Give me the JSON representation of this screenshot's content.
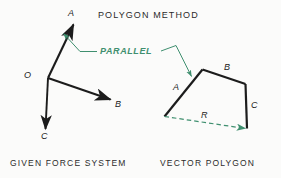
{
  "figure": {
    "title": "POLYGON METHOD",
    "captions": {
      "left": "GIVEN FORCE SYSTEM",
      "right": "VECTOR POLYGON"
    },
    "annotation": {
      "parallel_label": "PARALLEL"
    },
    "colors": {
      "ink": "#1c1c1c",
      "accent_green": "#3f8f6f",
      "background": "#fbfbfa"
    },
    "force_system": {
      "origin_label": "O",
      "vectors": [
        {
          "label": "A",
          "direction": "up-right"
        },
        {
          "label": "B",
          "direction": "down-right"
        },
        {
          "label": "C",
          "direction": "down"
        }
      ]
    },
    "vector_polygon": {
      "sides": [
        {
          "label": "A"
        },
        {
          "label": "B"
        },
        {
          "label": "C"
        }
      ],
      "resultant_label": "R"
    }
  }
}
